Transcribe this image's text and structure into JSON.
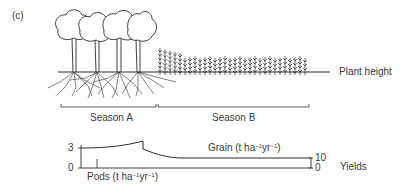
{
  "figure": {
    "panel_label": "(c)",
    "plant_height_label": "Plant height",
    "seasons": [
      {
        "label": "Season A"
      },
      {
        "label": "Season B"
      }
    ],
    "yields_label": "Yields",
    "left_axis": {
      "ticks": [
        "3",
        "0"
      ]
    },
    "right_axis": {
      "ticks": [
        "10",
        "0"
      ]
    },
    "pods_label": {
      "prefix": "Pods (t ha",
      "sup1": "−1",
      "mid": "yr",
      "sup2": "−1",
      "suffix": ")"
    },
    "grain_label": {
      "prefix": "Grain (t ha",
      "sup1": "−1",
      "mid": "yr",
      "sup2": "−1",
      "suffix": ")"
    },
    "colors": {
      "ink": "#2b2b2b",
      "text": "#3a3a3a"
    }
  },
  "chart_data": {
    "type": "line",
    "title": "",
    "xlabel": "",
    "ylabel": "Yields",
    "series": [
      {
        "name": "Pods (t ha-1 yr-1)",
        "axis": "left",
        "x": [
          "Season A start",
          "Season A end"
        ],
        "values": [
          3,
          3.6
        ]
      },
      {
        "name": "Grain (t ha-1 yr-1)",
        "axis": "right",
        "x": [
          "Season B start",
          "Season B early",
          "Season B end"
        ],
        "values": [
          10,
          5,
          5
        ]
      }
    ],
    "left_ylim": [
      0,
      3
    ],
    "right_ylim": [
      0,
      10
    ]
  }
}
